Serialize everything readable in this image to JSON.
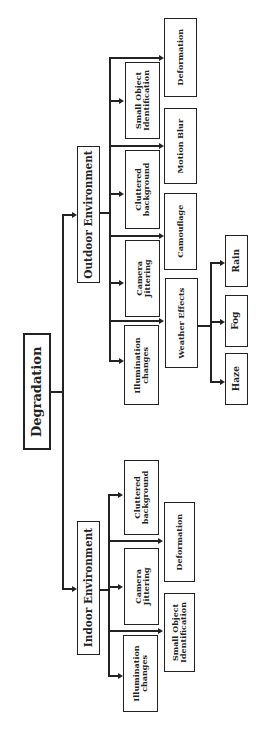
{
  "diagram": {
    "root": "Degradation",
    "outdoor": {
      "label": "Outdoor Environment",
      "level1": [
        "Small Object\nIdentification",
        "Cluttered\nbackground",
        "Camera\nJittering",
        "Illumination\nchanges"
      ],
      "level2": [
        "Deformation",
        "Motion Blur",
        "Camouflage",
        "Weather Effects"
      ],
      "weather": [
        "Rain",
        "Fog",
        "Haze"
      ]
    },
    "indoor": {
      "label": "Indoor Environment",
      "level1": [
        "Cluttered\nbackground",
        "Camera\nJittering",
        "Illumination\nchanges"
      ],
      "level2": [
        "Deformation",
        "Small Object\nIdentification"
      ]
    }
  }
}
